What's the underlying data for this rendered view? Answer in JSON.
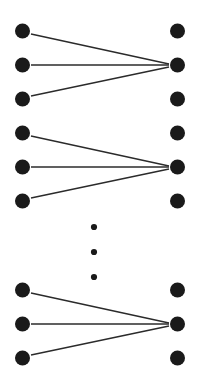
{
  "figure": {
    "type": "diagram",
    "width": 203,
    "height": 382,
    "background_color": "#ffffff"
  },
  "style": {
    "node_color": "#1a1a1a",
    "node_radius": 7.5,
    "edge_color": "#2b2b2b",
    "edge_width": 1.4,
    "ellipsis_color": "#1a1a1a",
    "ellipsis_radius": 3.1
  },
  "left_column": {
    "name": "left-nodes",
    "x": 22.5,
    "nodes": [
      {
        "id": "L1",
        "y": 31
      },
      {
        "id": "L2",
        "y": 65
      },
      {
        "id": "L3",
        "y": 99
      },
      {
        "id": "L4",
        "y": 133
      },
      {
        "id": "L5",
        "y": 167
      },
      {
        "id": "L6",
        "y": 201
      },
      {
        "id": "L7",
        "y": 290
      },
      {
        "id": "L8",
        "y": 324
      },
      {
        "id": "L9",
        "y": 358
      }
    ]
  },
  "right_column": {
    "name": "right-nodes",
    "x": 177.5,
    "nodes": [
      {
        "id": "R1",
        "y": 31
      },
      {
        "id": "R2",
        "y": 65
      },
      {
        "id": "R3",
        "y": 99
      },
      {
        "id": "R4",
        "y": 133
      },
      {
        "id": "R5",
        "y": 167
      },
      {
        "id": "R6",
        "y": 201
      },
      {
        "id": "R7",
        "y": 290
      },
      {
        "id": "R8",
        "y": 324
      },
      {
        "id": "R9",
        "y": 358
      }
    ]
  },
  "edges": [
    {
      "from": "L1",
      "to": "R2",
      "x1": 31,
      "y1": 34,
      "x2": 169,
      "y2": 64
    },
    {
      "from": "L2",
      "to": "R2",
      "x1": 31,
      "y1": 65,
      "x2": 169,
      "y2": 65
    },
    {
      "from": "L3",
      "to": "R2",
      "x1": 31,
      "y1": 96,
      "x2": 169,
      "y2": 67
    },
    {
      "from": "L4",
      "to": "R5",
      "x1": 31,
      "y1": 136,
      "x2": 169,
      "y2": 166
    },
    {
      "from": "L5",
      "to": "R5",
      "x1": 31,
      "y1": 167,
      "x2": 169,
      "y2": 167
    },
    {
      "from": "L6",
      "to": "R5",
      "x1": 31,
      "y1": 198,
      "x2": 169,
      "y2": 169
    },
    {
      "from": "L7",
      "to": "R8",
      "x1": 31,
      "y1": 293,
      "x2": 169,
      "y2": 323
    },
    {
      "from": "L8",
      "to": "R8",
      "x1": 31,
      "y1": 324,
      "x2": 169,
      "y2": 324
    },
    {
      "from": "L9",
      "to": "R8",
      "x1": 31,
      "y1": 355,
      "x2": 169,
      "y2": 326
    }
  ],
  "ellipsis": {
    "name": "vertical-ellipsis",
    "x": 94,
    "dots": [
      {
        "y": 227
      },
      {
        "y": 252
      },
      {
        "y": 277
      }
    ]
  }
}
